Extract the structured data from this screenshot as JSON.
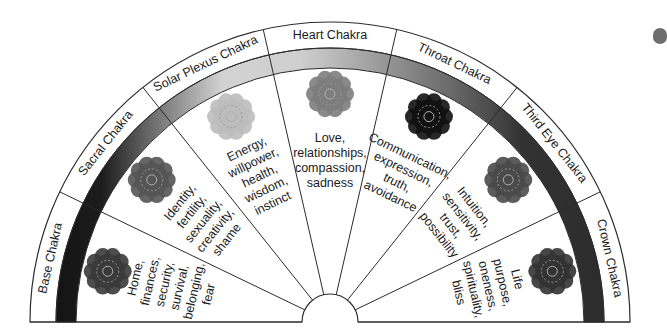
{
  "diagram": {
    "center": [
      330,
      322
    ],
    "outer_radius": 300,
    "label_ring_inner_radius": 274,
    "band_inner_radius": 254,
    "hub_radius": 28,
    "colors": {
      "stroke": "#2b2b2b",
      "background": "#ffffff",
      "text": "#1a1a1a"
    },
    "chakras": [
      {
        "name": "Base Chakra",
        "description": [
          "Home,",
          "finances,",
          "security,",
          "survival,",
          "belonging,",
          "fear"
        ],
        "band_color": "#141414",
        "icon": "base-mandala-icon",
        "icon_color": "#3a3a3a"
      },
      {
        "name": "Sacral Chakra",
        "description": [
          "Identity,",
          "fertility,",
          "sexuality,",
          "creativity,",
          "shame"
        ],
        "band_color": "#6a6a6a",
        "icon": "sacral-mandala-icon",
        "icon_color": "#555555"
      },
      {
        "name": "Solar Plexus Chakra",
        "description": [
          "Energy,",
          "willpower,",
          "health,",
          "wisdom,",
          "instinct"
        ],
        "band_color": "#c8c8c8",
        "icon": "solar-plexus-mandala-icon",
        "icon_color": "#bdbdbd"
      },
      {
        "name": "Heart Chakra",
        "description": [
          "Love,",
          "relationships,",
          "compassion,",
          "sadness"
        ],
        "band_color": "#a0a0a0",
        "icon": "heart-mandala-icon",
        "icon_color": "#7d7d7d"
      },
      {
        "name": "Throat Chakra",
        "description": [
          "Communication,",
          "expression,",
          "truth,",
          "avoidance"
        ],
        "band_color": "#6c6c6c",
        "icon": "throat-mandala-icon",
        "icon_color": "#111111"
      },
      {
        "name": "Third Eye Chakra",
        "description": [
          "Intuition,",
          "sensitivity,",
          "trust,",
          "possibility"
        ],
        "band_color": "#3c3c3c",
        "icon": "third-eye-mandala-icon",
        "icon_color": "#4a4a4a"
      },
      {
        "name": "Crown Chakra",
        "description": [
          "Life",
          "purpose,",
          "oneness,",
          "spirituality,",
          "bliss"
        ],
        "band_color": "#2e2e2e",
        "icon": "crown-mandala-icon",
        "icon_color": "#333333"
      }
    ]
  }
}
